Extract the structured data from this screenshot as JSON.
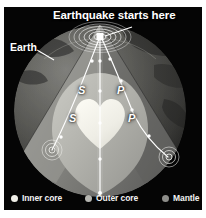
{
  "figure": {
    "background_color": "#ffffff",
    "plate_color": "#050505",
    "title": "Earthquake starts here",
    "earth_label": "Earth"
  },
  "diagram": {
    "epicenter_name": "earthquake-focus",
    "wave_labels": [
      {
        "label": "S",
        "x": 74,
        "y": 78
      },
      {
        "label": "S",
        "x": 65,
        "y": 106
      },
      {
        "label": "P",
        "x": 113,
        "y": 78
      },
      {
        "label": "P",
        "x": 124,
        "y": 106
      }
    ],
    "stations": [
      {
        "name": "station-left",
        "x": 48,
        "y": 142
      },
      {
        "name": "station-right",
        "x": 165,
        "y": 149
      }
    ]
  },
  "colors": {
    "inner_core": "#f0efe8",
    "outer_core": "#b9b9b4",
    "mantle": "#8e8e8a",
    "mantle_shadow": "#6f6f6c",
    "crust_dark": "#2b2b2b",
    "ray": "#ffffff",
    "background": "#050505",
    "text": "#ffffff"
  },
  "legend": {
    "items": [
      {
        "label": "Inner core",
        "color": "#f0efe8"
      },
      {
        "label": "Outer core",
        "color": "#b6b6b1"
      },
      {
        "label": "Mantle",
        "color": "#8d8d89"
      }
    ]
  }
}
